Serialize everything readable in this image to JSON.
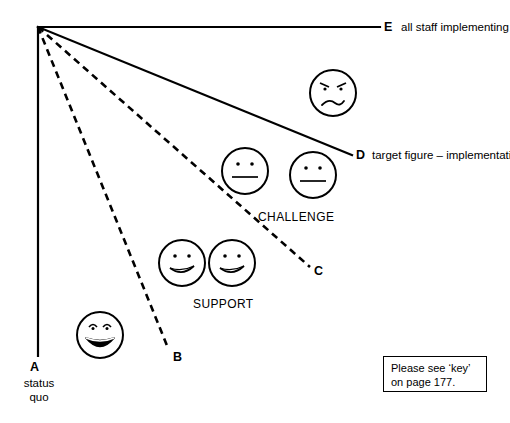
{
  "diagram": {
    "background_color": "#ffffff",
    "line_color": "#000000",
    "apex": {
      "x": 38,
      "y": 27
    },
    "nodes": [
      {
        "id": "A",
        "letter": "A",
        "caption": "status\nquo",
        "line_style": "solid",
        "endpoint": {
          "x": 38,
          "y": 356
        }
      },
      {
        "id": "B",
        "letter": "B",
        "caption": "",
        "line_style": "dashed",
        "endpoint": {
          "x": 168,
          "y": 348
        }
      },
      {
        "id": "C",
        "letter": "C",
        "caption": "",
        "line_style": "dashed",
        "endpoint": {
          "x": 310,
          "y": 267
        }
      },
      {
        "id": "D",
        "letter": "D",
        "caption": "target figure – implementation is sufficiently widespread to be considered whole-school practice",
        "line_style": "solid",
        "endpoint": {
          "x": 352,
          "y": 155
        }
      },
      {
        "id": "E",
        "letter": "E",
        "caption": "all staff implementing new practice",
        "line_style": "solid",
        "endpoint": {
          "x": 380,
          "y": 27
        }
      }
    ],
    "zone_labels": [
      {
        "name": "support",
        "text": "SUPPORT"
      },
      {
        "name": "challenge",
        "text": "CHALLENGE"
      }
    ],
    "faces": [
      {
        "name": "face-grinning",
        "expression": "grinning",
        "cx": 100,
        "cy": 335,
        "r": 23
      },
      {
        "name": "face-smiling-1",
        "expression": "slight-smile",
        "cx": 182,
        "cy": 263,
        "r": 23
      },
      {
        "name": "face-smiling-2",
        "expression": "slight-smile",
        "cx": 232,
        "cy": 263,
        "r": 23
      },
      {
        "name": "face-neutral-1",
        "expression": "neutral",
        "cx": 245,
        "cy": 171,
        "r": 23
      },
      {
        "name": "face-neutral-2",
        "expression": "neutral",
        "cx": 313,
        "cy": 175,
        "r": 23
      },
      {
        "name": "face-frowning",
        "expression": "frowning",
        "cx": 333,
        "cy": 93,
        "r": 23
      }
    ],
    "key_note": "Please see ‘key’\non page 177."
  }
}
